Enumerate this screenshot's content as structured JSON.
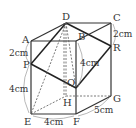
{
  "figure": {
    "type": "rectangular_prism",
    "vertices": {
      "A": {
        "label": "A",
        "x": 31,
        "y": 41
      },
      "B": {
        "label": "B",
        "x": 76,
        "y": 41
      },
      "C": {
        "label": "C",
        "x": 111,
        "y": 23
      },
      "D": {
        "label": "D",
        "x": 66,
        "y": 23
      },
      "E": {
        "label": "E",
        "x": 31,
        "y": 114
      },
      "F": {
        "label": "F",
        "x": 76,
        "y": 114
      },
      "G": {
        "label": "G",
        "x": 111,
        "y": 96
      },
      "H": {
        "label": "H",
        "x": 66,
        "y": 96
      },
      "P": {
        "label": "P",
        "x": 31,
        "y": 64
      },
      "Q": {
        "label": "Q",
        "x": 76,
        "y": 88
      },
      "R": {
        "label": "R",
        "x": 111,
        "y": 46
      }
    },
    "dimensions": {
      "AP": "2cm",
      "PE": "4cm",
      "EF": "4cm",
      "FG": "5cm",
      "CR": "2cm",
      "BQ": "4cm"
    }
  }
}
